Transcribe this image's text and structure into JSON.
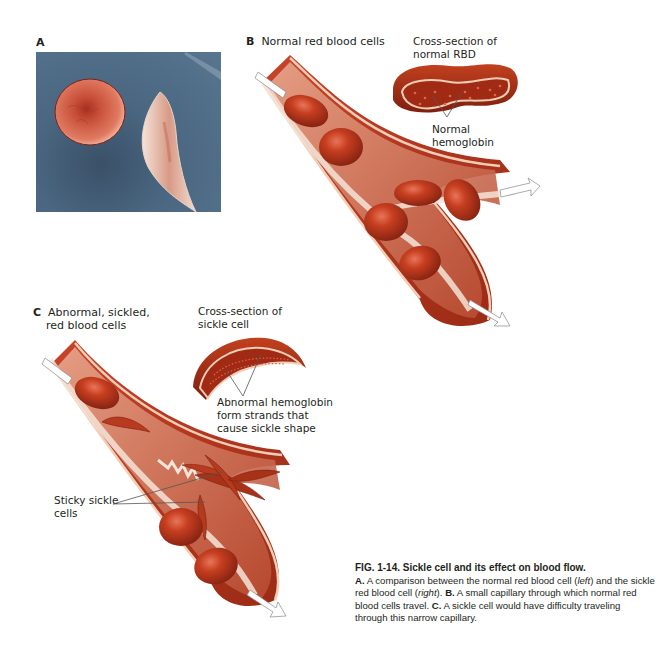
{
  "figure": {
    "panels": {
      "a": {
        "letter": "A"
      },
      "b": {
        "letter": "B",
        "title": "Normal red blood cells",
        "cross_section_label_line1": "Cross-section of",
        "cross_section_label_line2": "normal RBD",
        "hemoglobin_label_line1": "Normal",
        "hemoglobin_label_line2": "hemoglobin"
      },
      "c": {
        "letter": "C",
        "title_line1": "Abnormal, sickled,",
        "title_line2": "red blood cells",
        "cross_section_label_line1": "Cross-section of",
        "cross_section_label_line2": "sickle cell",
        "hemoglobin_label_line1": "Abnormal hemoglobin",
        "hemoglobin_label_line2": "form strands that",
        "hemoglobin_label_line3": "cause sickle shape",
        "sticky_label_line1": "Sticky sickle",
        "sticky_label_line2": "cells"
      }
    },
    "caption": {
      "title": "FIG. 1-14.  Sickle cell and its effect on blood flow.",
      "a_letter": "A.",
      "a_text_1": " A comparison between the normal red blood cell (",
      "a_left": "left",
      "a_text_2": ") and the sickle red blood cell (",
      "a_right": "right",
      "a_text_3": "). ",
      "b_letter": "B.",
      "b_text": " A small capillary through which normal red blood cells travel. ",
      "c_letter": "C.",
      "c_text": " A sickle cell would have difficulty traveling through this narrow capillary."
    },
    "colors": {
      "vessel_wall": "#b8321c",
      "vessel_inner": "#9e2a15",
      "vessel_lining": "#f2c9b0",
      "cell": "#c23a1e",
      "micrograph_bg": "#4a6680",
      "flow_channel": "#f3e2d6"
    }
  }
}
